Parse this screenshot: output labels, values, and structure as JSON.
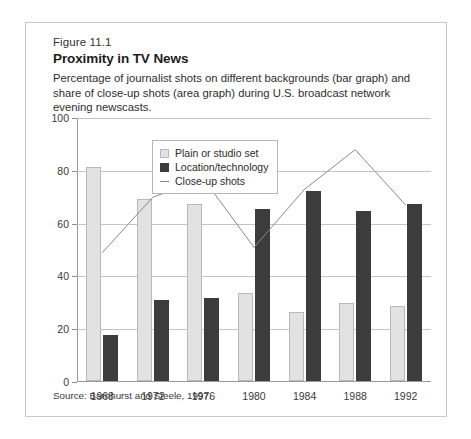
{
  "figure": {
    "number": "Figure 11.1",
    "title": "Proximity in TV News",
    "subtitle": "Percentage of journalist shots on different backgrounds (bar graph) and share of close-up shots (area graph) during U.S. broadcast network evening newscasts.",
    "source": "Source: Barnhurst and Steele, 1997."
  },
  "legend": {
    "position": "inside-top-left",
    "items": [
      {
        "label": "Plain or studio set",
        "marker": "swatch-light",
        "color": "#e2e2e2"
      },
      {
        "label": "Location/technology",
        "marker": "swatch-dark",
        "color": "#3c3c3c"
      },
      {
        "label": "Close-up shots",
        "marker": "line",
        "color": "#8a8a8a"
      }
    ]
  },
  "chart_data": {
    "type": "bar",
    "title": "Proximity in TV News",
    "subtitle": "Percentage of journalist shots on different backgrounds (bar graph) and share of close-up shots (area graph) during U.S. broadcast network evening newscasts.",
    "xlabel": "",
    "ylabel": "",
    "categories": [
      "1968",
      "1972",
      "1976",
      "1980",
      "1984",
      "1988",
      "1992"
    ],
    "ylim": [
      0,
      100
    ],
    "yticks": [
      0,
      20,
      40,
      60,
      80,
      100
    ],
    "ytick_labels": [
      "0",
      "20",
      "40",
      "60",
      "80",
      "100"
    ],
    "grid": true,
    "legend_position": "upper left inside",
    "series": [
      {
        "name": "Plain or studio set",
        "type": "bar",
        "color": "#e2e2e2",
        "values": [
          81,
          69,
          67,
          33.5,
          26,
          29.5,
          28.5
        ]
      },
      {
        "name": "Location/technology",
        "type": "bar",
        "color": "#3c3c3c",
        "values": [
          17.5,
          30.5,
          31.5,
          65,
          72,
          64.5,
          67
        ]
      },
      {
        "name": "Close-up shots",
        "type": "line",
        "color": "#8a8a8a",
        "values": [
          49,
          70,
          77,
          51,
          73,
          88,
          67
        ]
      }
    ],
    "source": "Source: Barnhurst and Steele, 1997."
  }
}
